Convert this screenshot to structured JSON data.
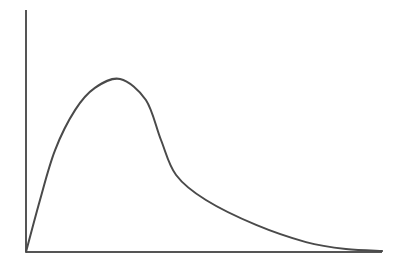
{
  "chart_data": {
    "type": "line",
    "title": "",
    "xlabel": "",
    "ylabel": "",
    "grid": false,
    "legend": null,
    "xlim": [
      0,
      10
    ],
    "ylim": [
      0,
      1
    ],
    "series": [
      {
        "name": "distribution curve",
        "x": [
          0,
          0.39,
          0.81,
          1.37,
          1.92,
          2.62,
          3.34,
          3.76,
          4.18,
          5.01,
          6.41,
          7.8,
          8.91,
          9.92
        ],
        "y": [
          0,
          0.215,
          0.421,
          0.587,
          0.678,
          0.715,
          0.628,
          0.463,
          0.318,
          0.215,
          0.112,
          0.041,
          0.012,
          0.004
        ]
      }
    ],
    "annotations": []
  },
  "colors": {
    "background": "#ffffff",
    "axis": "#555555",
    "curve": "#4a4a4a"
  }
}
